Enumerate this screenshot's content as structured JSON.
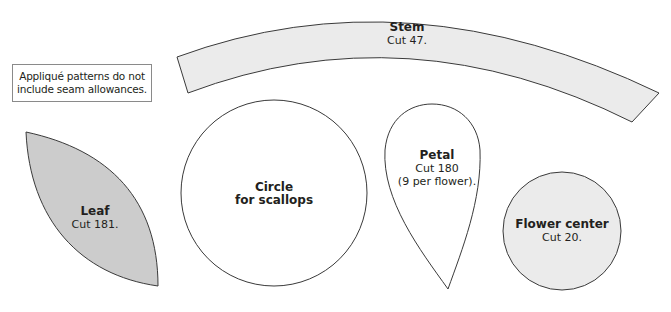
{
  "note": {
    "line1": "Appliqué patterns do not",
    "line2": "include seam allowances."
  },
  "shapes": {
    "stem": {
      "title": "Stem",
      "cut": "Cut 47.",
      "fill": "#ebebeb"
    },
    "leaf": {
      "title": "Leaf",
      "cut": "Cut 181.",
      "fill": "#cccccc"
    },
    "circle": {
      "title_line1": "Circle",
      "title_line2": "for scallops",
      "fill": "#ffffff"
    },
    "petal": {
      "title": "Petal",
      "cut_line1": "Cut 180",
      "cut_line2": "(9 per flower).",
      "fill": "#ffffff"
    },
    "flower_center": {
      "title": "Flower center",
      "cut": "Cut 20.",
      "fill": "#ebebeb"
    }
  },
  "colors": {
    "outline": "#3a3a3a",
    "text": "#231f20"
  }
}
